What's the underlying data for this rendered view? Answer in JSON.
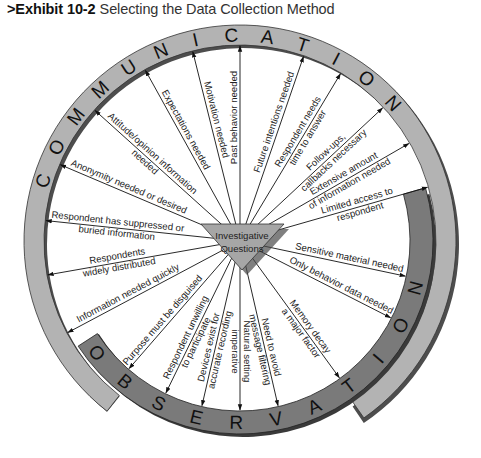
{
  "title": {
    "exhibit": ">Exhibit 10-2",
    "text": "Selecting the Data Collection Method"
  },
  "center": {
    "line1": "Investigative",
    "line2": "Questions"
  },
  "rings": {
    "communication": {
      "label": "COMMUNICATION",
      "color": "#b3b3b3"
    },
    "observation": {
      "label": "OBSERVATION",
      "color": "#7a7a7a"
    }
  },
  "spokes": [
    {
      "id": "anonymity",
      "lines": [
        "Anonymity needed or desired"
      ],
      "angle": 203,
      "target": "communication"
    },
    {
      "id": "attitude",
      "lines": [
        "Attitude/opinion information",
        "needed"
      ],
      "angle": 222,
      "target": "communication"
    },
    {
      "id": "expectations",
      "lines": [
        "Expectations needed"
      ],
      "angle": 241,
      "target": "communication"
    },
    {
      "id": "motivation",
      "lines": [
        "Motivation needed"
      ],
      "angle": 256,
      "target": "communication"
    },
    {
      "id": "past-behavior",
      "lines": [
        "Past behavior needed"
      ],
      "angle": 270,
      "target": "communication"
    },
    {
      "id": "future-intentions",
      "lines": [
        "Future intentions needed"
      ],
      "angle": 289,
      "target": "communication"
    },
    {
      "id": "respondent-time",
      "lines": [
        "Respondent needs",
        "time to answer"
      ],
      "angle": 301,
      "target": "communication"
    },
    {
      "id": "follow-ups",
      "lines": [
        "Follow-ups,",
        "callbacks necessary"
      ],
      "angle": 317,
      "target": "communication"
    },
    {
      "id": "extensive-info",
      "lines": [
        "Extensive amount",
        "of information needed"
      ],
      "angle": 330,
      "target": "communication"
    },
    {
      "id": "limited-access",
      "lines": [
        "Limited access to",
        "respondent"
      ],
      "angle": 344,
      "target": "communication"
    },
    {
      "id": "suppressed-info",
      "lines": [
        "Respondent has suppressed or",
        "buried information"
      ],
      "angle": 186,
      "target": "communication"
    },
    {
      "id": "widely-distributed",
      "lines": [
        "Respondents",
        "widely distributed"
      ],
      "angle": 170,
      "target": "communication"
    },
    {
      "id": "info-quickly",
      "lines": [
        "Information needed quickly"
      ],
      "angle": 152,
      "target": "communication"
    },
    {
      "id": "sensitive-material",
      "lines": [
        "Sensitive material needed"
      ],
      "angle": 12,
      "target": "observation"
    },
    {
      "id": "behavior-only",
      "lines": [
        "Only behavior data needed"
      ],
      "angle": 27,
      "target": "observation"
    },
    {
      "id": "memory-decay",
      "lines": [
        "Memory decay",
        "a major factor"
      ],
      "angle": 54,
      "target": "observation"
    },
    {
      "id": "message-filtering",
      "lines": [
        "Need to avoid",
        "message filtering"
      ],
      "angle": 77,
      "target": "observation"
    },
    {
      "id": "natural-setting",
      "lines": [
        "Natural setting",
        "imperative"
      ],
      "angle": 90,
      "target": "observation"
    },
    {
      "id": "devices-exist",
      "lines": [
        "Devices exist for",
        "accurate recording"
      ],
      "angle": 103,
      "target": "observation"
    },
    {
      "id": "unwilling",
      "lines": [
        "Respondent unwilling",
        "to participate"
      ],
      "angle": 116,
      "target": "observation"
    },
    {
      "id": "purpose-disguised",
      "lines": [
        "Purpose must be disguised"
      ],
      "angle": 131,
      "target": "observation"
    }
  ]
}
